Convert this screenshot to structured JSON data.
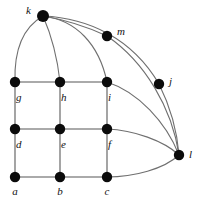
{
  "figure": {
    "kind": "undirected-graph-diagram",
    "width": 201,
    "height": 202,
    "background_color": "#ffffff",
    "node_color": "#0b0b0b",
    "grid_edge_color": "#8e8e8e",
    "curve_edge_color": "#6f6f6f",
    "label_color": "#121212",
    "label_style": "italic-serif"
  },
  "nodes": [
    {
      "id": "a",
      "label": "a",
      "x": 15,
      "y": 177,
      "r": 5.2,
      "label_x": 15,
      "label_y": 192,
      "label_anchor": "middle"
    },
    {
      "id": "b",
      "label": "b",
      "x": 60,
      "y": 177,
      "r": 5.2,
      "label_x": 60,
      "label_y": 192,
      "label_anchor": "middle"
    },
    {
      "id": "c",
      "label": "c",
      "x": 107,
      "y": 177,
      "r": 5.2,
      "label_x": 107,
      "label_y": 192,
      "label_anchor": "middle"
    },
    {
      "id": "d",
      "label": "d",
      "x": 15,
      "y": 129,
      "r": 5.2,
      "label_x": 16,
      "label_y": 145,
      "label_anchor": "start"
    },
    {
      "id": "e",
      "label": "e",
      "x": 60,
      "y": 129,
      "r": 5.2,
      "label_x": 61,
      "label_y": 145,
      "label_anchor": "start"
    },
    {
      "id": "f",
      "label": "f",
      "x": 107,
      "y": 129,
      "r": 5.2,
      "label_x": 108,
      "label_y": 145,
      "label_anchor": "start"
    },
    {
      "id": "g",
      "label": "g",
      "x": 15,
      "y": 82,
      "r": 5.2,
      "label_x": 16,
      "label_y": 98,
      "label_anchor": "start"
    },
    {
      "id": "h",
      "label": "h",
      "x": 60,
      "y": 82,
      "r": 5.2,
      "label_x": 61,
      "label_y": 98,
      "label_anchor": "start"
    },
    {
      "id": "i",
      "label": "i",
      "x": 107,
      "y": 82,
      "r": 5.2,
      "label_x": 108,
      "label_y": 98,
      "label_anchor": "start"
    },
    {
      "id": "j",
      "label": "j",
      "x": 159,
      "y": 84,
      "r": 5.2,
      "label_x": 169,
      "label_y": 82,
      "label_anchor": "start"
    },
    {
      "id": "k",
      "label": "k",
      "x": 43,
      "y": 16,
      "r": 6.0,
      "label_x": 31,
      "label_y": 11,
      "label_anchor": "end"
    },
    {
      "id": "l",
      "label": "l",
      "x": 179,
      "y": 155,
      "r": 5.2,
      "label_x": 189,
      "label_y": 155,
      "label_anchor": "start"
    },
    {
      "id": "m",
      "label": "m",
      "x": 107,
      "y": 36,
      "r": 5.2,
      "label_x": 117,
      "label_y": 32,
      "label_anchor": "start"
    }
  ],
  "edges": [
    {
      "from": "a",
      "to": "b",
      "kind": "grid",
      "path": "M 15 177 L 60 177"
    },
    {
      "from": "b",
      "to": "c",
      "kind": "grid",
      "path": "M 60 177 L 107 177"
    },
    {
      "from": "d",
      "to": "e",
      "kind": "grid",
      "path": "M 15 129 L 60 129"
    },
    {
      "from": "e",
      "to": "f",
      "kind": "grid",
      "path": "M 60 129 L 107 129"
    },
    {
      "from": "g",
      "to": "h",
      "kind": "grid",
      "path": "M 15 82 L 60 82"
    },
    {
      "from": "h",
      "to": "i",
      "kind": "grid",
      "path": "M 60 82 L 107 82"
    },
    {
      "from": "a",
      "to": "d",
      "kind": "grid",
      "path": "M 15 177 L 15 129"
    },
    {
      "from": "d",
      "to": "g",
      "kind": "grid",
      "path": "M 15 129 L 15 82"
    },
    {
      "from": "b",
      "to": "e",
      "kind": "grid",
      "path": "M 60 177 L 60 129"
    },
    {
      "from": "e",
      "to": "h",
      "kind": "grid",
      "path": "M 60 129 L 60 82"
    },
    {
      "from": "c",
      "to": "f",
      "kind": "grid",
      "path": "M 107 177 L 107 129"
    },
    {
      "from": "f",
      "to": "i",
      "kind": "grid",
      "path": "M 107 129 L 107 82"
    },
    {
      "from": "k",
      "to": "g",
      "kind": "curve",
      "path": "M 43 16 C 22 28 14 52 15 82"
    },
    {
      "from": "k",
      "to": "h",
      "kind": "curve",
      "path": "M 43 16 C 50 32 57 54 60 82"
    },
    {
      "from": "k",
      "to": "i",
      "kind": "curve",
      "path": "M 43 16 C 76 20 99 44 107 82"
    },
    {
      "from": "k",
      "to": "m",
      "kind": "curve",
      "path": "M 43 16 C 66 20 90 28 107 36"
    },
    {
      "from": "k",
      "to": "j",
      "kind": "curve",
      "path": "M 43 16 C 88 18 132 38 159 84"
    },
    {
      "from": "m",
      "to": "l",
      "kind": "curve",
      "path": "M 107 36 C 145 62 172 108 179 155"
    },
    {
      "from": "j",
      "to": "l",
      "kind": "curve",
      "path": "M 159 84 C 170 106 177 130 179 155"
    },
    {
      "from": "i",
      "to": "l",
      "kind": "curve",
      "path": "M 107 82 C 138 92 166 122 179 155"
    },
    {
      "from": "f",
      "to": "l",
      "kind": "curve",
      "path": "M 107 129 C 134 130 164 141 179 155"
    },
    {
      "from": "c",
      "to": "l",
      "kind": "curve",
      "path": "M 107 177 C 134 177 164 169 179 155"
    }
  ]
}
